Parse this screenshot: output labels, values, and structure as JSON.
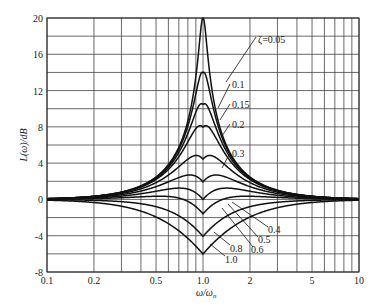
{
  "chart_data": {
    "type": "line",
    "title": "",
    "xlabel": "ω/ω_n",
    "ylabel": "L(ω)/dB",
    "xscale": "log",
    "xlim": [
      0.1,
      10
    ],
    "ylim": [
      -8,
      20
    ],
    "grid": true,
    "x_ticks": [
      "0.1",
      "0.2",
      "0.5",
      "1.0",
      "2",
      "5",
      "10"
    ],
    "x_tick_values": [
      0.1,
      0.2,
      0.5,
      1.0,
      2,
      5,
      10
    ],
    "y_ticks": [
      "20",
      "16",
      "12",
      "8",
      "4",
      "0",
      "-4",
      "-8"
    ],
    "y_tick_values": [
      20,
      16,
      12,
      8,
      4,
      0,
      -4,
      -8
    ],
    "series": [
      {
        "name": "ζ=0.05",
        "zeta": 0.05,
        "label": "ζ=0.05"
      },
      {
        "name": "0.1",
        "zeta": 0.1,
        "label": "0.1"
      },
      {
        "name": "0.15",
        "zeta": 0.15,
        "label": "0.15"
      },
      {
        "name": "0.2",
        "zeta": 0.2,
        "label": "0.2"
      },
      {
        "name": "0.3",
        "zeta": 0.3,
        "label": "0.3"
      },
      {
        "name": "0.4",
        "zeta": 0.4,
        "label": "0.4"
      },
      {
        "name": "0.5",
        "zeta": 0.5,
        "label": "0.5"
      },
      {
        "name": "0.6",
        "zeta": 0.6,
        "label": "0.6"
      },
      {
        "name": "0.8",
        "zeta": 0.8,
        "label": "0.8"
      },
      {
        "name": "1.0",
        "zeta": 1.0,
        "label": "1.0"
      }
    ],
    "peak_values_db_at_resonance": {
      "0.05": 19.3,
      "0.1": 14.0,
      "0.15": 10.5,
      "0.2": 8.0,
      "0.3": 4.4,
      "0.4": 1.9,
      "0.5": 0.0,
      "0.6": -1.6,
      "0.8": -4.1,
      "1.0": -6.0
    }
  },
  "labels": {
    "ylabel": "L(ω)/dB",
    "xlabel": "ω/ω",
    "xlabel_sub": "n"
  }
}
